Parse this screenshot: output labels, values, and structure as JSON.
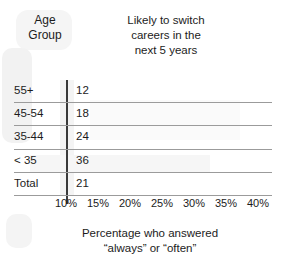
{
  "header": {
    "age_group_label": "Age\nGroup",
    "title": "Likely to switch careers in the next 5 years",
    "title_line1": "Likely to switch",
    "title_line2": "careers in the",
    "title_line3": "next 5 years"
  },
  "footer": {
    "caption_line1": "Percentage who answered",
    "caption_line2": "“always” or “often”"
  },
  "chart_data": {
    "type": "bar",
    "orientation": "horizontal",
    "title": "Likely to switch careers in the next 5 years",
    "xlabel": "Percentage who answered “always” or “often”",
    "ylabel": "Age Group",
    "categories": [
      "55+",
      "45-54",
      "35-44",
      "< 35",
      "Total"
    ],
    "values": [
      12,
      18,
      24,
      36,
      21
    ],
    "value_suffix": "",
    "xlim": [
      10,
      40
    ],
    "xticks": [
      10,
      15,
      20,
      25,
      30,
      35,
      40
    ],
    "xtick_labels": [
      "10%",
      "15%",
      "20%",
      "25%",
      "30%",
      "35%",
      "40%"
    ],
    "grid": false,
    "legend": "none",
    "note": "Bars are not drawn; only numeric values are printed next to the axis baseline at 10%."
  },
  "rows": [
    {
      "label": "55+",
      "value": "12"
    },
    {
      "label": "45-54",
      "value": "18"
    },
    {
      "label": "35-44",
      "value": "24"
    },
    {
      "label": "< 35",
      "value": "36"
    },
    {
      "label": "Total",
      "value": "21"
    }
  ],
  "xticks": [
    {
      "label": "10%",
      "x": 66
    },
    {
      "label": "15%",
      "x": 98
    },
    {
      "label": "20%",
      "x": 130
    },
    {
      "label": "25%",
      "x": 162
    },
    {
      "label": "30%",
      "x": 194
    },
    {
      "label": "35%",
      "x": 226
    },
    {
      "label": "40%",
      "x": 258
    }
  ],
  "colors": {
    "background": "#ffffff",
    "text": "#1c1c1c",
    "axis": "#3a3a3a",
    "rule": "#9b9b9b"
  }
}
